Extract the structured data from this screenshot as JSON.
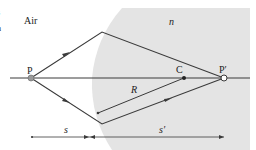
{
  "diagram": {
    "colors": {
      "medium_fill": "#e4e4e4",
      "line": "#3a3a3a",
      "background": "#ffffff",
      "point_P": "#9a9a9a"
    },
    "regions": {
      "left_label": "Air",
      "right_label": "n"
    },
    "points": {
      "object": "P",
      "image": "P′",
      "center": "C"
    },
    "radius_label": "R",
    "dimensions": {
      "object_distance": "s",
      "image_distance": "s′"
    },
    "edge_fragments": [
      "s",
      "n"
    ]
  }
}
